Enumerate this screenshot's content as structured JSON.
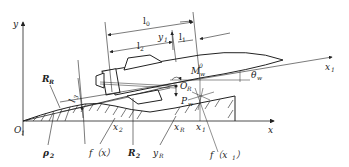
{
  "diagram": {
    "axes": {
      "origin": "O",
      "origin_sub": "1",
      "x_axis": "x",
      "y_axis": "y",
      "body_axis": "x",
      "body_axis_sub": "1"
    },
    "dimensions": {
      "l0": "l",
      "l0_sub": "0",
      "l1": "l",
      "l1_sub": "1",
      "l2": "l",
      "l2_sub": "2",
      "l3": "l",
      "l3_sub": "3",
      "y1": "y",
      "y1_sub": "1"
    },
    "points": {
      "M": "M",
      "M_sub": "w",
      "M_sup": "0",
      "OR": "O",
      "OR_sub": "R",
      "Pw": "P",
      "Pw_sub": "w",
      "theta": "θ",
      "theta_sub": "w"
    },
    "bottom_labels": {
      "x2": "x",
      "x2_sub": "2",
      "xR": "x",
      "xR_sub": "R",
      "x1": "x",
      "x1_sub": "1",
      "rho2": "ρ",
      "rho2_sub": "2",
      "fx": "f（x）",
      "R2": "R",
      "R2_sub": "2",
      "yR": "y",
      "yR_sub": "R",
      "fx1": "f（x",
      "fx1_sub": "1",
      "fx1_end": "）"
    },
    "left_labels": {
      "RR": "R",
      "RR_sub": "R"
    }
  }
}
